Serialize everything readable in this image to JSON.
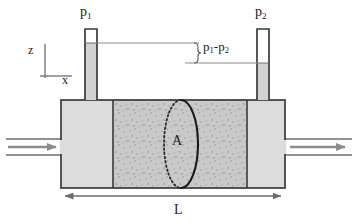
{
  "figure": {
    "kind": "packed-bed-pressure-drop-diagram",
    "background_color": "#ffffff"
  },
  "labels": {
    "pressure_left": {
      "base": "p",
      "sub": "1",
      "full": "p1"
    },
    "pressure_right": {
      "base": "p",
      "sub": "2",
      "full": "p2"
    },
    "pressure_difference": {
      "full": "p1-p2",
      "base_a": "p",
      "sub_a": "1",
      "dash": "-",
      "base_b": "p",
      "sub_b": "2"
    },
    "axis_vertical": "z",
    "axis_horizontal": "x",
    "cross_section_area": "A",
    "bed_length": "L"
  },
  "colors": {
    "outline": "#3a3a3a",
    "chamber_fill": "#dcdcdc",
    "packed_bed_fill": "#c9c9c9",
    "manometer_liquid": "#d2d2d2",
    "manometer_empty": "#ffffff",
    "flow_arrow": "#8c8c8c",
    "dimension_line": "#6e6e6e",
    "text": "#1a1a1a",
    "area_solid_arc": "#1a1a1a",
    "area_dotted_arc": "#2a2a2a"
  },
  "geometry": {
    "vessel": {
      "x": 61,
      "y": 100,
      "width": 224,
      "height": 88
    },
    "packed_bed": {
      "x": 113,
      "y": 100,
      "width": 134,
      "height": 88
    },
    "left_chamber": {
      "x": 61,
      "y": 100,
      "width": 52,
      "height": 88
    },
    "right_chamber": {
      "x": 247,
      "y": 100,
      "width": 38,
      "height": 88
    },
    "tube_left": {
      "x": 85,
      "y": 29,
      "width": 12,
      "height": 71,
      "liquid_level_y": 43
    },
    "tube_right": {
      "x": 257,
      "y": 29,
      "width": 12,
      "height": 71,
      "liquid_level_y": 63
    },
    "level_line_upper": {
      "x1": 97,
      "y": 43,
      "x2": 200
    },
    "level_line_lower": {
      "x1": 185,
      "y": 63,
      "x2": 257
    },
    "brace": {
      "x": 196,
      "y_top": 43,
      "y_bottom": 63
    },
    "inlet_pipe": {
      "x1": 6,
      "x2": 61,
      "y_top": 139,
      "y_bottom": 155
    },
    "outlet_pipe": {
      "x1": 285,
      "x2": 352,
      "y_top": 139,
      "y_bottom": 155
    },
    "area_ellipse": {
      "cx": 181,
      "cy": 144,
      "rx": 17,
      "ry": 44
    },
    "dimension_L": {
      "x1": 65,
      "x2": 283,
      "y": 196
    },
    "axes_origin": {
      "x": 45,
      "y": 76
    }
  },
  "elements": {
    "inlet_flow_arrow": "flow-arrow-right",
    "outlet_flow_arrow": "flow-arrow-right",
    "dimension_arrow": "double-headed-arrow",
    "brace_shape": "right-curly-brace"
  }
}
